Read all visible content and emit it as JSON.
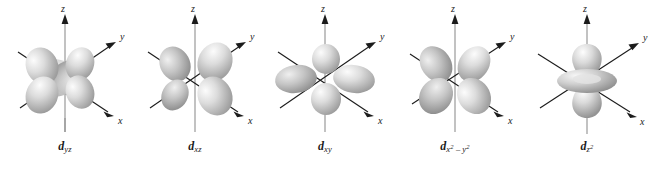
{
  "figure": {
    "name": "five-d-orbital-shapes",
    "background_color": "#ffffff",
    "lobe_color_light": "#f2f2f2",
    "lobe_color_mid": "#c9c9c9",
    "lobe_color_dark": "#8f8f8f",
    "axis_color": "#1b1b1b"
  },
  "axes": {
    "z": "z",
    "y": "y",
    "x": "x"
  },
  "panels": [
    {
      "id": "d-yz",
      "symbol": "d",
      "subscript": "yz",
      "shape": "cloverleaf",
      "lobe_angles": [
        35,
        145,
        215,
        325
      ],
      "axis_labels": {
        "z": "z",
        "y": "y",
        "x": "x"
      }
    },
    {
      "id": "d-xz",
      "symbol": "d",
      "subscript": "xz",
      "shape": "cloverleaf",
      "lobe_angles": [
        35,
        145,
        215,
        325
      ],
      "axis_labels": {
        "z": "z",
        "y": "y",
        "x": "x"
      }
    },
    {
      "id": "d-xy",
      "symbol": "d",
      "subscript": "xy",
      "shape": "cloverleaf",
      "lobe_angles": [
        0,
        90,
        180,
        270
      ],
      "axis_labels": {
        "z": "z",
        "y": "y",
        "x": "x"
      }
    },
    {
      "id": "d-x2-y2",
      "symbol": "d",
      "subscript_parts": [
        {
          "base": "x",
          "exp": "2"
        },
        {
          "op": " – "
        },
        {
          "base": "y",
          "exp": "2"
        }
      ],
      "shape": "cloverleaf",
      "lobe_angles": [
        50,
        130,
        230,
        310
      ],
      "axis_labels": {
        "z": "z",
        "y": "y",
        "x": "x"
      }
    },
    {
      "id": "d-z2",
      "symbol": "d",
      "subscript_parts": [
        {
          "base": "z",
          "exp": "2"
        }
      ],
      "shape": "dumbbell-with-torus",
      "axis_labels": {
        "z": "z",
        "y": "y",
        "x": "x"
      }
    }
  ]
}
